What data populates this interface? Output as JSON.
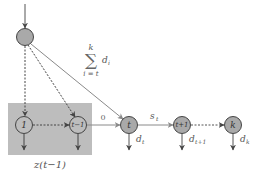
{
  "diagram": {
    "colors": {
      "node_fill": "#a9a9a9",
      "node_stroke": "#444444",
      "box_fill": "#bdbdbd",
      "edge": "#555555",
      "edge_light": "#8a8a8a",
      "text": "#555555"
    },
    "nodes": [
      {
        "id": "root",
        "label": ""
      },
      {
        "id": "n1",
        "label": "1"
      },
      {
        "id": "ntm1",
        "label": "t−1"
      },
      {
        "id": "nt",
        "label": "t"
      },
      {
        "id": "ntp1",
        "label": "t+1"
      },
      {
        "id": "nk",
        "label": "k"
      }
    ],
    "group_box": {
      "label": "z(t−1)"
    },
    "edge_labels": {
      "zero": "0",
      "s_t_main": "s",
      "s_t_sub": "t",
      "sum_top": "k",
      "sum_symbol": "∑",
      "sum_bottom": "i = t",
      "sum_term_main": "d",
      "sum_term_sub": "i"
    },
    "output_labels": [
      {
        "main": "d",
        "sub": "t"
      },
      {
        "main": "d",
        "sub": "t+1"
      },
      {
        "main": "d",
        "sub": "k"
      }
    ]
  }
}
